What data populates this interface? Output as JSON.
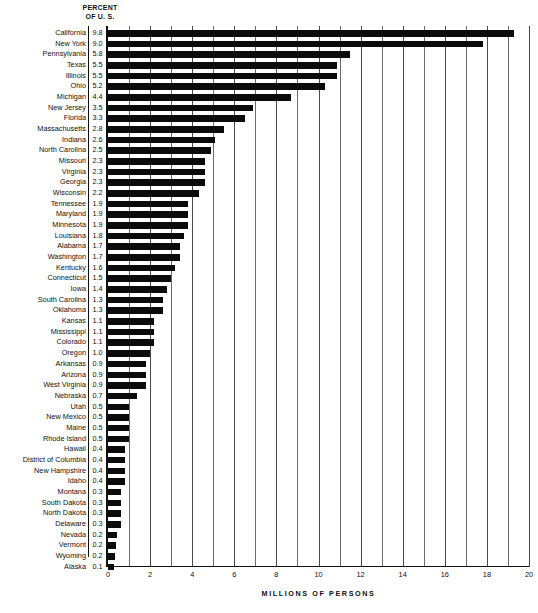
{
  "header": {
    "line1": "PERCENT",
    "line2": "OF U. S."
  },
  "axis": {
    "xlabel": "MILLIONS OF PERSONS",
    "tick_labels": [
      "0",
      "2",
      "4",
      "6",
      "8",
      "10",
      "12",
      "14",
      "16",
      "18",
      "20"
    ]
  },
  "chart_data": {
    "type": "bar",
    "orientation": "horizontal",
    "title": "",
    "subtitle": "",
    "xlabel": "MILLIONS OF PERSONS",
    "ylabel": "",
    "xlim": [
      0,
      20
    ],
    "grid": true,
    "grid_interval": 1,
    "tick_interval": 2,
    "legend": "none",
    "value_column_header": "PERCENT OF U. S.",
    "categories": [
      "California",
      "New York",
      "Pennsylvania",
      "Texas",
      "Illinois",
      "Ohio",
      "Michigan",
      "New Jersey",
      "Florida",
      "Massachusetts",
      "Indiana",
      "North Carolina",
      "Missouri",
      "Virginia",
      "Georgia",
      "Wisconsin",
      "Tennessee",
      "Maryland",
      "Minnesota",
      "Louisiana",
      "Alabama",
      "Washington",
      "Kentucky",
      "Connecticut",
      "Iowa",
      "South Carolina",
      "Oklahoma",
      "Kansas",
      "Mississippi",
      "Colorado",
      "Oregon",
      "Arkansas",
      "Arizona",
      "West Virginia",
      "Nebraska",
      "Utah",
      "New Mexico",
      "Maine",
      "Rhode Island",
      "Hawaii",
      "District of Columbia",
      "New Hampshire",
      "Idaho",
      "Montana",
      "South Dakota",
      "North Dakota",
      "Delaware",
      "Nevada",
      "Vermont",
      "Wyoming",
      "Alaska"
    ],
    "percent_values": [
      9.8,
      9.0,
      5.8,
      5.5,
      5.5,
      5.2,
      4.4,
      3.5,
      3.3,
      2.8,
      2.6,
      2.5,
      2.3,
      2.3,
      2.3,
      2.2,
      1.9,
      1.9,
      1.9,
      1.8,
      1.7,
      1.7,
      1.6,
      1.5,
      1.4,
      1.3,
      1.3,
      1.1,
      1.1,
      1.1,
      1.0,
      0.9,
      0.9,
      0.9,
      0.7,
      0.5,
      0.5,
      0.5,
      0.5,
      0.4,
      0.4,
      0.4,
      0.4,
      0.3,
      0.3,
      0.3,
      0.3,
      0.2,
      0.2,
      0.2,
      0.1
    ],
    "values": [
      19.3,
      17.8,
      11.5,
      10.9,
      10.9,
      10.3,
      8.7,
      6.9,
      6.5,
      5.5,
      5.1,
      4.9,
      4.6,
      4.6,
      4.6,
      4.3,
      3.8,
      3.8,
      3.8,
      3.6,
      3.4,
      3.4,
      3.2,
      3.0,
      2.8,
      2.6,
      2.6,
      2.2,
      2.2,
      2.2,
      2.0,
      1.8,
      1.8,
      1.8,
      1.4,
      1.0,
      1.0,
      1.0,
      1.0,
      0.8,
      0.8,
      0.8,
      0.8,
      0.6,
      0.6,
      0.6,
      0.6,
      0.45,
      0.4,
      0.35,
      0.28
    ]
  },
  "colors": {
    "bar": "#0b0b0b",
    "grid": "#6d6d6d",
    "axis": "#111111",
    "background": "#ffffff"
  }
}
